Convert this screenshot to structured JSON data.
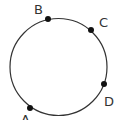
{
  "diagram": {
    "type": "circle-with-points",
    "circle": {
      "cx": 58.5,
      "cy": 67,
      "r": 48.5,
      "stroke": "#333333",
      "stroke_width": 1.2
    },
    "points": [
      {
        "id": "A",
        "label": "A",
        "x": 30,
        "y": 108,
        "label_x": 21,
        "label_y": 124
      },
      {
        "id": "B",
        "label": "B",
        "x": 48,
        "y": 19,
        "label_x": 34,
        "label_y": 14
      },
      {
        "id": "C",
        "label": "C",
        "x": 91,
        "y": 30,
        "label_x": 99,
        "label_y": 27
      },
      {
        "id": "D",
        "label": "D",
        "x": 104,
        "y": 84,
        "label_x": 104,
        "label_y": 106
      }
    ],
    "point_color": "#111111",
    "point_radius": 3
  }
}
